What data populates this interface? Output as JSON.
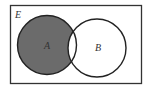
{
  "diagram": {
    "type": "venn",
    "universal_set": {
      "label": "E"
    },
    "sets": [
      {
        "label": "A",
        "shaded": "only-A"
      },
      {
        "label": "B",
        "shaded": "none"
      }
    ],
    "shaded_region": "A minus B",
    "colors": {
      "shade": "#6b6b6b",
      "stroke": "#222222",
      "background": "#ffffff"
    }
  }
}
